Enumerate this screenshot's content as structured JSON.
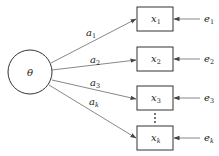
{
  "diagram": {
    "type": "factor-model",
    "latent": {
      "label": "θ"
    },
    "indicators": [
      {
        "name": "x",
        "sub": "1",
        "loading": "a",
        "loading_sub": "1",
        "error": "e",
        "error_sub": "1"
      },
      {
        "name": "x",
        "sub": "2",
        "loading": "a",
        "loading_sub": "2",
        "error": "e",
        "error_sub": "2"
      },
      {
        "name": "x",
        "sub": "3",
        "loading": "a",
        "loading_sub": "3",
        "error": "e",
        "error_sub": "3"
      },
      {
        "name": "x",
        "sub": "k",
        "loading": "a",
        "loading_sub": "k",
        "error": "e",
        "error_sub": "k"
      }
    ],
    "ellipsis": "⋮",
    "colors": {
      "stroke": "#333333",
      "arrow": "#555555",
      "background": "#ffffff"
    }
  }
}
